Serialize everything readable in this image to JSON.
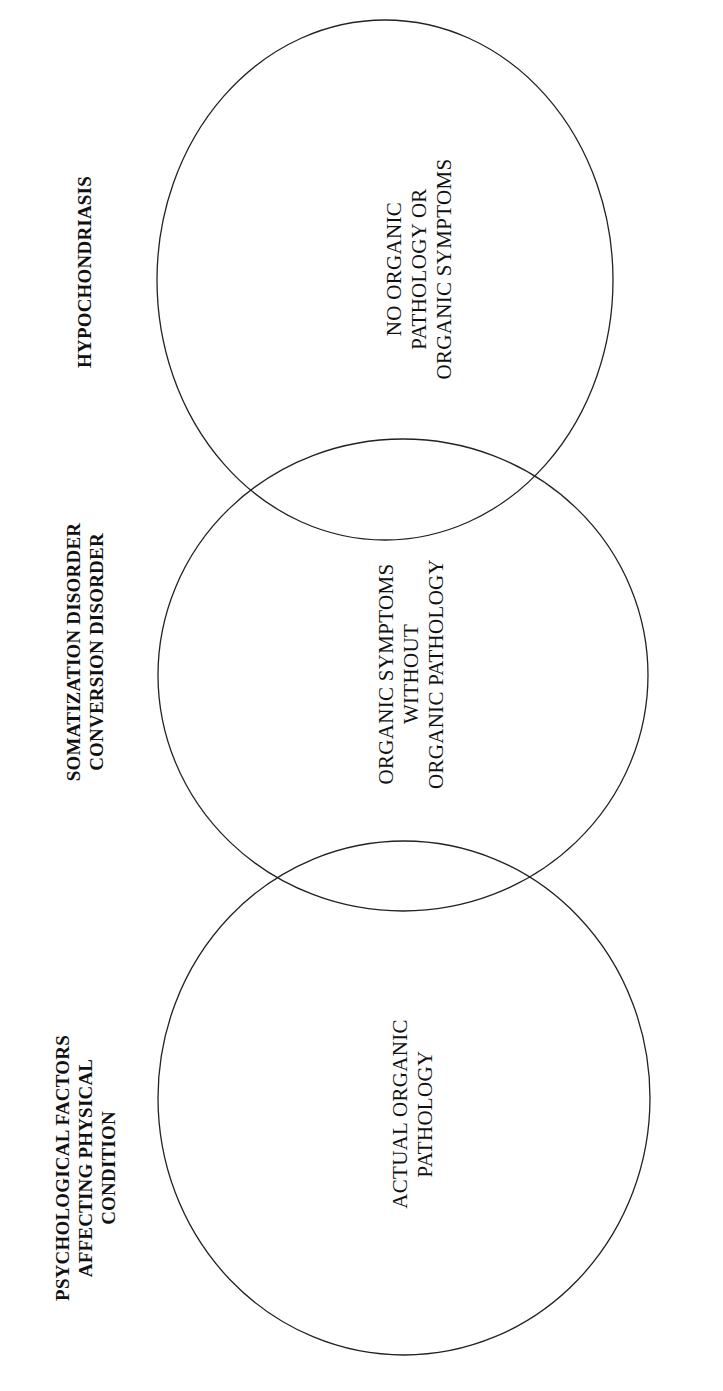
{
  "diagram": {
    "type": "venn",
    "orientation": "rotated-90-ccw",
    "line_color": "#222222",
    "headings": [
      {
        "id": "psychological-factors",
        "lines": [
          "PSYCHOLOGICAL FACTORS",
          "AFFECTING PHYSICAL",
          "CONDITION"
        ]
      },
      {
        "id": "somatization-conversion",
        "lines": [
          "SOMATIZATION DISORDER",
          "CONVERSION DISORDER"
        ]
      },
      {
        "id": "hypochondriasis",
        "lines": [
          "HYPOCHONDRIASIS"
        ]
      }
    ],
    "circles": [
      {
        "id": "actual-organic-pathology",
        "lines": [
          "ACTUAL ORGANIC",
          "PATHOLOGY"
        ],
        "cx": 404,
        "cy": 1098,
        "rx": 246,
        "ry": 257
      },
      {
        "id": "organic-symptoms-without-pathology",
        "lines": [
          "ORGANIC SYMPTOMS",
          "WITHOUT",
          "ORGANIC PATHOLOGY"
        ],
        "cx": 403,
        "cy": 675,
        "rx": 245,
        "ry": 236
      },
      {
        "id": "no-organic-pathology-or-symptoms",
        "lines": [
          "NO ORGANIC",
          "PATHOLOGY OR",
          "ORGANIC SYMPTOMS"
        ],
        "cx": 385,
        "cy": 280,
        "rx": 228,
        "ry": 260
      }
    ]
  }
}
